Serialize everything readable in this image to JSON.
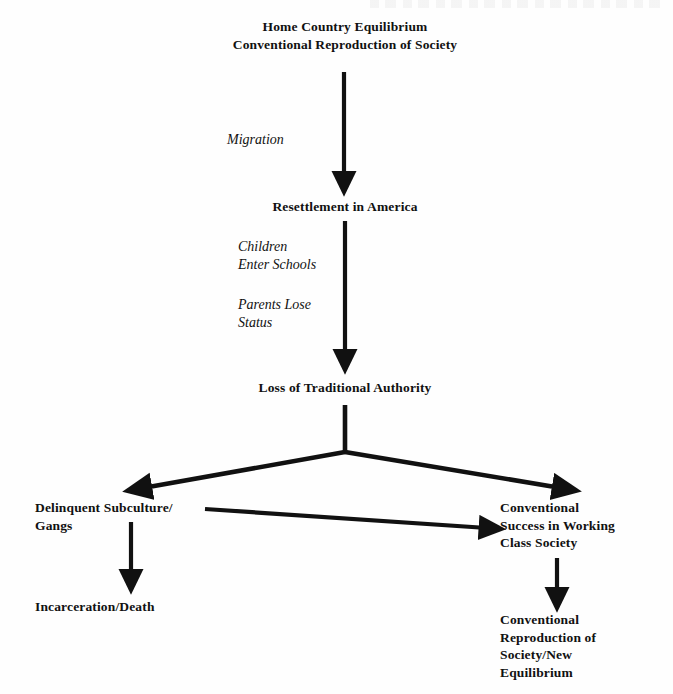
{
  "diagram": {
    "background_color": "#fefefe",
    "ink_color": "#111111",
    "nodes": [
      {
        "id": "home-country",
        "text": "Home Country Equilibrium\nConventional Reproduction of Society"
      },
      {
        "id": "resettlement",
        "text": "Resettlement in America"
      },
      {
        "id": "loss-authority",
        "text": "Loss of Traditional Authority"
      },
      {
        "id": "delinquent",
        "text": "Delinquent Subculture/\nGangs"
      },
      {
        "id": "conventional-success",
        "text": "Conventional\nSuccess in Working\nClass Society"
      },
      {
        "id": "incarceration",
        "text": "Incarceration/Death"
      },
      {
        "id": "new-equilibrium",
        "text": "Conventional\nReproduction of\nSociety/New\nEquilibrium"
      }
    ],
    "edge_labels": [
      {
        "id": "migration",
        "text": "Migration"
      },
      {
        "id": "children-enter-schools",
        "text": "Children\nEnter Schools"
      },
      {
        "id": "parents-lose-status",
        "text": "Parents Lose\nStatus"
      }
    ]
  }
}
